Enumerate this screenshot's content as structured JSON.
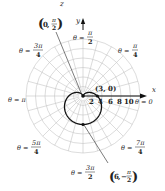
{
  "diagram": {
    "type": "polar-graph",
    "equation_hint": "cardioid r = 3 - 3 sin θ",
    "axis_labels": {
      "z": "z",
      "y": "y",
      "x": "x"
    },
    "angle_labels": [
      {
        "id": "pi2",
        "text": "θ = π/2",
        "num": "π",
        "den": "2"
      },
      {
        "id": "pi4",
        "text": "θ = π/4",
        "num": "π",
        "den": "4"
      },
      {
        "id": "3pi4",
        "text": "θ = 3π/4",
        "num": "3π",
        "den": "4"
      },
      {
        "id": "pi",
        "text": "θ = π"
      },
      {
        "id": "0",
        "text": "θ = 0"
      },
      {
        "id": "5pi4",
        "text": "θ = 5π/4",
        "num": "5π",
        "den": "4"
      },
      {
        "id": "3pi2",
        "text": "θ = 3π/2",
        "num": "3π",
        "den": "2"
      },
      {
        "id": "7pi4",
        "text": "θ = 7π/4",
        "num": "7π",
        "den": "4"
      }
    ],
    "radial_ticks": [
      "2",
      "4",
      "6",
      "8",
      "10"
    ],
    "points": [
      {
        "label": "(3, 0)",
        "r": 3,
        "theta": "0"
      },
      {
        "label": "(0, π/2)",
        "r": 0,
        "theta": "π/2",
        "r_text": "0",
        "num": "π",
        "den": "2"
      },
      {
        "label": "(6, −π/2)",
        "r": 6,
        "theta": "−π/2",
        "r_text": "6",
        "num": "π",
        "den": "2"
      }
    ],
    "theta_prefix": "θ =",
    "colors": {
      "grid": "#bdbdbd",
      "curve": "#111111",
      "text": "#222222"
    }
  }
}
